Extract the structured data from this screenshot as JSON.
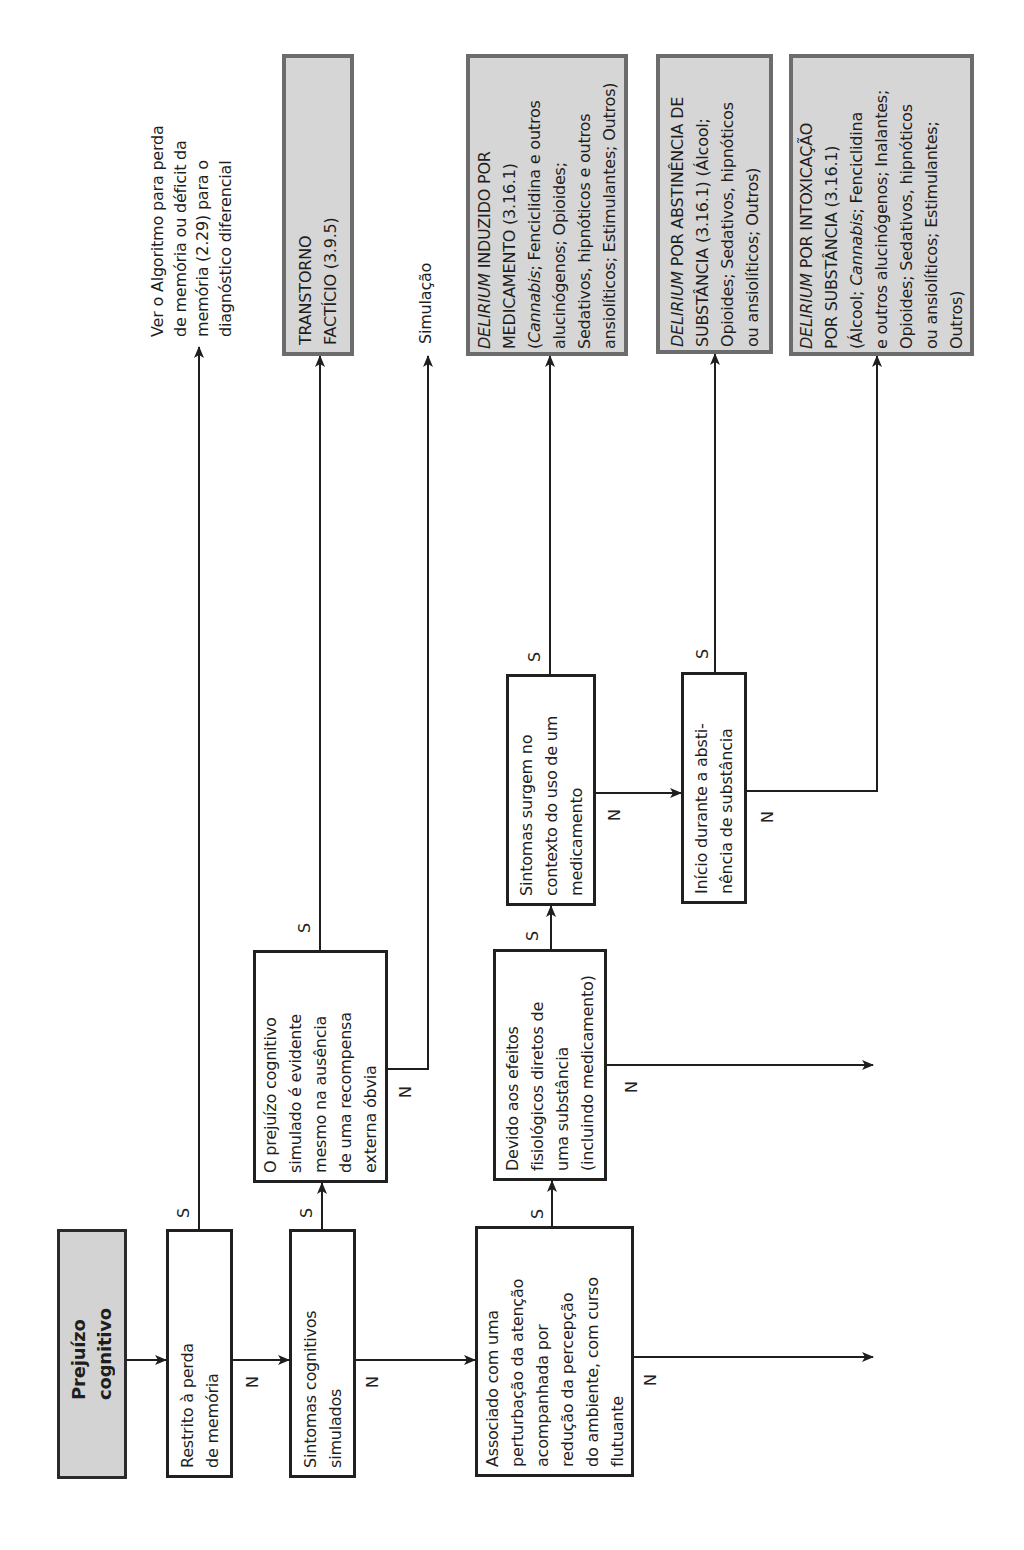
{
  "diagram": {
    "type": "decision-tree-flowchart",
    "orientation": "rotated 90° counter-clockwise",
    "branch_labels": {
      "yes": "S",
      "no": "N"
    },
    "start": {
      "text": "Prejuízo\ncognitivo"
    },
    "decisions": [
      {
        "id": "restrito",
        "text": "Restrito à perda\nde memória",
        "yes_to": "ver-algoritmo",
        "no_to": "simulados"
      },
      {
        "id": "simulados",
        "text": "Sintomas cognitivos\nsimulados",
        "yes_to": "evidente",
        "no_to": "associado"
      },
      {
        "id": "evidente",
        "text": "O prejuízo cognitivo\nsimulado é evidente\nmesmo na ausência\nde uma recompensa\nexterna óbvia",
        "yes_to": "facticio",
        "no_to": "simulacao"
      },
      {
        "id": "associado",
        "text": "Associado com uma\nperturbação da atenção\nacompanhada por\nredução da percepção\ndo ambiente, com curso\nflutuante",
        "yes_to": "devido",
        "no_to": "continues"
      },
      {
        "id": "devido",
        "text": "Devido aos efeitos\nfisiológicos diretos de\numa substância\n(incluindo medicamento)",
        "yes_to": "medicamento",
        "no_to": "continues"
      },
      {
        "id": "medicamento",
        "text": "Sintomas surgem no\ncontexto do uso de um\nmedicamento",
        "yes_to": "delirium-medicamento",
        "no_to": "abstinencia"
      },
      {
        "id": "abstinencia",
        "text": "Início durante a absti-\nnência de substância",
        "yes_to": "delirium-abstinencia",
        "no_to": "delirium-intoxicacao"
      }
    ],
    "outcomes": [
      {
        "id": "ver-algoritmo",
        "text": "Ver o Algoritmo para perda\nde memória ou déficit da\nmemória (2.29) para o\ndiagnóstico diferencial"
      },
      {
        "id": "facticio",
        "text": "TRANSTORNO\nFACTÍCIO (3.9.5)"
      },
      {
        "id": "simulacao",
        "text": "Simulação"
      },
      {
        "id": "delirium-medicamento",
        "segments": [
          {
            "text": "DELIRIUM",
            "italic": true
          },
          {
            "text": " INDUZIDO POR\nMEDICAMENTO (3.16.1)\n(",
            "italic": false
          },
          {
            "text": "Cannabis",
            "italic": true
          },
          {
            "text": "; Fenciclidina e outros\nalucinógenos; Opioides;\nSedativos, hipnóticos e outros\nansiolíticos; Estimulantes; Outros)",
            "italic": false
          }
        ]
      },
      {
        "id": "delirium-abstinencia",
        "segments": [
          {
            "text": "DELIRIUM",
            "italic": true
          },
          {
            "text": " POR ABSTINÊNCIA DE\nSUBSTÂNCIA (3.16.1) (Álcool;\nOpioides; Sedativos, hipnóticos\nou ansiolíticos; Outros)",
            "italic": false
          }
        ]
      },
      {
        "id": "delirium-intoxicacao",
        "segments": [
          {
            "text": "DELIRIUM",
            "italic": true
          },
          {
            "text": " POR INTOXICAÇÃO\nPOR SUBSTÂNCIA (3.16.1)\n(Álcool; ",
            "italic": false
          },
          {
            "text": "Cannabis",
            "italic": true
          },
          {
            "text": "; Fenciclidina\ne outros alucinógenos; Inalantes;\nOpioides; Sedativos, hipnóticos\nou ansiolíticos; Estimulantes;\nOutros)",
            "italic": false
          }
        ]
      }
    ],
    "colors": {
      "line": "#1e1e1e",
      "shaded_fill": "#d6d6d6",
      "shaded_border": "#6c6c6c",
      "box_border": "#202020"
    }
  }
}
